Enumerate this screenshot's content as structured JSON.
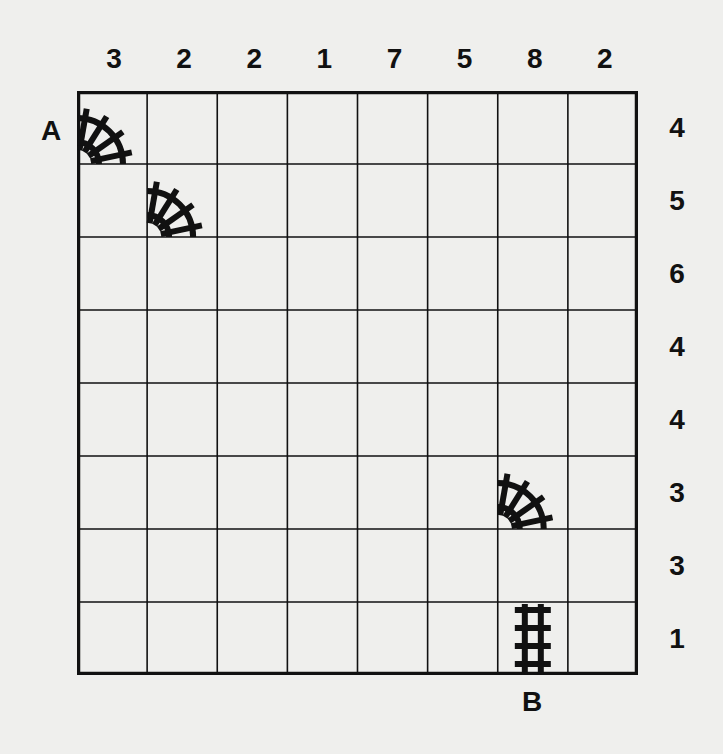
{
  "puzzle": {
    "type": "train-tracks",
    "rows": 8,
    "cols": 8,
    "column_clues": [
      3,
      2,
      2,
      1,
      7,
      5,
      8,
      2
    ],
    "row_clues": [
      4,
      5,
      6,
      4,
      4,
      3,
      3,
      1
    ],
    "start_label": "A",
    "end_label": "B",
    "start_position": {
      "row": 0,
      "side": "left"
    },
    "end_position": {
      "col": 6,
      "side": "bottom"
    },
    "given_pieces": [
      {
        "row": 0,
        "col": 0,
        "piece": "curve-left-bottom"
      },
      {
        "row": 1,
        "col": 1,
        "piece": "curve-left-bottom"
      },
      {
        "row": 5,
        "col": 6,
        "piece": "curve-left-bottom"
      },
      {
        "row": 7,
        "col": 6,
        "piece": "straight-vertical"
      }
    ]
  },
  "colors": {
    "background": "#efefed",
    "ink": "#111111"
  }
}
